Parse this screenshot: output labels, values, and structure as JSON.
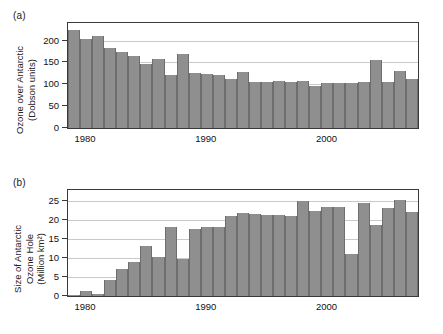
{
  "figure": {
    "panels": [
      {
        "key": "a",
        "label": "(a)",
        "ylabel": "Ozone over Antarctic\n(Dobson units)"
      },
      {
        "key": "b",
        "label": "(b)",
        "ylabel": "Size of Antarctic\nOzone Hole\n(Million km²)"
      }
    ]
  },
  "chart_data": [
    {
      "type": "bar",
      "panel": "a",
      "title": "",
      "xlabel": "",
      "ylabel": "Ozone over Antarctic (Dobson units)",
      "ylim": [
        0,
        240
      ],
      "yticks": [
        0,
        50,
        100,
        150,
        200
      ],
      "ytick_labels": [
        "0",
        "50",
        "100",
        "150",
        "200"
      ],
      "grid": true,
      "grid_axis": "y",
      "legend": "none",
      "bar_color": "#8f8f8f",
      "x": [
        1979,
        1980,
        1981,
        1982,
        1983,
        1984,
        1985,
        1986,
        1987,
        1988,
        1989,
        1990,
        1991,
        1992,
        1993,
        1994,
        1995,
        1996,
        1997,
        1998,
        1999,
        2000,
        2001,
        2002,
        2003,
        2004,
        2005,
        2006,
        2007
      ],
      "xtick_positions": [
        1980,
        1990,
        2000
      ],
      "xtick_labels": [
        "1980",
        "1990",
        "2000"
      ],
      "categories": [
        "1979",
        "1980",
        "1981",
        "1982",
        "1983",
        "1984",
        "1985",
        "1986",
        "1987",
        "1988",
        "1989",
        "1990",
        "1991",
        "1992",
        "1993",
        "1994",
        "1995",
        "1996",
        "1997",
        "1998",
        "1999",
        "2000",
        "2001",
        "2002",
        "2003",
        "2004",
        "2005",
        "2006",
        "2007"
      ],
      "values": [
        224,
        203,
        210,
        184,
        173,
        164,
        146,
        157,
        121,
        170,
        125,
        123,
        121,
        112,
        129,
        105,
        105,
        107,
        106,
        107,
        95,
        102,
        102,
        103,
        105,
        156,
        105,
        130,
        111,
        105,
        110,
        107
      ]
    },
    {
      "type": "bar",
      "panel": "b",
      "title": "",
      "xlabel": "",
      "ylabel": "Size of Antarctic Ozone Hole (Million km²)",
      "ylim": [
        0,
        28
      ],
      "yticks": [
        0,
        5,
        10,
        15,
        20,
        25
      ],
      "ytick_labels": [
        "0",
        "5",
        "10",
        "15",
        "20",
        "25"
      ],
      "grid": true,
      "grid_axis": "y",
      "legend": "none",
      "bar_color": "#8f8f8f",
      "x": [
        1979,
        1980,
        1981,
        1982,
        1983,
        1984,
        1985,
        1986,
        1987,
        1988,
        1989,
        1990,
        1991,
        1992,
        1993,
        1994,
        1995,
        1996,
        1997,
        1998,
        1999,
        2000,
        2001,
        2002,
        2003,
        2004,
        2005,
        2006,
        2007
      ],
      "xtick_positions": [
        1980,
        1990,
        2000
      ],
      "xtick_labels": [
        "1980",
        "1990",
        "2000"
      ],
      "categories": [
        "1979",
        "1980",
        "1981",
        "1982",
        "1983",
        "1984",
        "1985",
        "1986",
        "1987",
        "1988",
        "1989",
        "1990",
        "1991",
        "1992",
        "1993",
        "1994",
        "1995",
        "1996",
        "1997",
        "1998",
        "1999",
        "2000",
        "2001",
        "2002",
        "2003",
        "2004",
        "2005",
        "2006",
        "2007"
      ],
      "values": [
        0.3,
        1.2,
        0.6,
        4.3,
        7.1,
        9.1,
        13.3,
        10.3,
        18.2,
        9.7,
        17.7,
        18.2,
        18.1,
        21.1,
        21.8,
        21.7,
        21.5,
        21.5,
        21.2,
        25.2,
        22.4,
        23.4,
        23.5,
        11.0,
        24.5,
        18.8,
        23.3,
        25.4,
        22.1,
        24.7
      ]
    }
  ]
}
